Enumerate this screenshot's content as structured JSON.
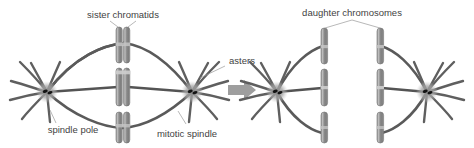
{
  "figure": {
    "background_color": "#ffffff",
    "width": 474,
    "height": 148
  },
  "colors": {
    "chromatid_fill": "#8c8c8c",
    "chromatid_stroke": "#6e6e6e",
    "chromatid_highlight": "#b3b3b3",
    "centromere_band": "#c9c9c9",
    "spindle_fiber": "#5a5a5a",
    "aster_ray": "#5f5f5f",
    "pole_halo": "#a9a9a9",
    "centriole": "#1c1c1c",
    "arrow": "#9e9e9e",
    "label_text": "#3f3f3f",
    "leader_line": "#9a9a9a"
  },
  "labels": {
    "sister_chromatids": "sister chromatids",
    "spindle_pole": "spindle pole",
    "mitotic_spindle": "mitotic spindle",
    "asters": "asters",
    "daughter_chromosomes": "daughter chromosomes"
  },
  "panels": [
    {
      "name": "metaphase",
      "description": "Metaphase: duplicated chromosomes aligned at the cell equator between two spindle poles",
      "poles": 2,
      "chromosome_pairs": 3,
      "labels_shown": [
        "sister chromatids",
        "spindle pole",
        "mitotic spindle",
        "asters"
      ]
    },
    {
      "name": "anaphase",
      "description": "Anaphase: sister chromatids separated into two sets of daughter chromosomes moving to opposite poles",
      "poles": 2,
      "chromosome_sets": 2,
      "chromosomes_per_set": 3,
      "labels_shown": [
        "daughter chromosomes"
      ]
    }
  ],
  "arrow": {
    "name": "process-arrow",
    "direction": "right",
    "meaning": "progression from metaphase to anaphase"
  }
}
